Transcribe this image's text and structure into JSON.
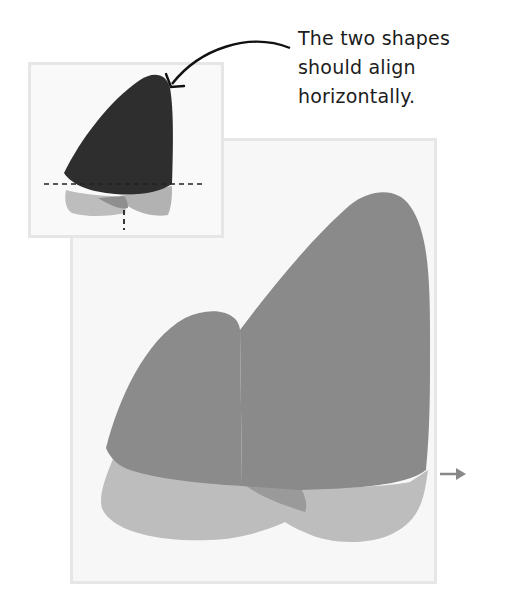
{
  "callout": {
    "lines": [
      "The two shapes",
      "should align",
      "horizontally."
    ]
  },
  "icons": {
    "callout_arrow": "curved-arrow-icon",
    "direction_arrow": "right-arrow-icon"
  },
  "colors": {
    "panel_bg": "#f7f7f7",
    "panel_border": "#e6e6e6",
    "shape_dark": "#2f2f2f",
    "shape_mid": "#8a8a8a",
    "shape_light": "#b8b8b8",
    "guide_line": "#222222",
    "arrow": "#888888"
  }
}
